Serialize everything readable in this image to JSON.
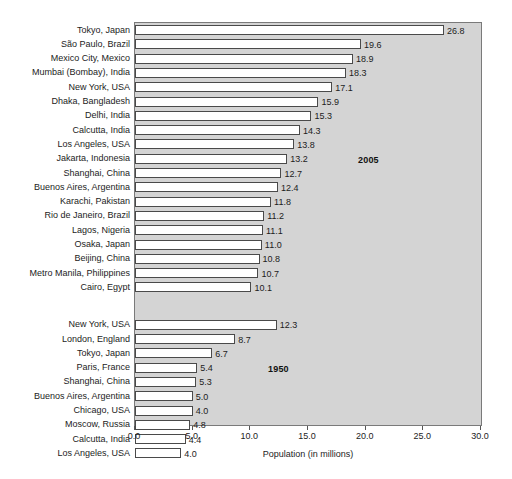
{
  "figure": {
    "clipped_top_text": "",
    "axis_title": "Population (in millions)",
    "group_labels": {
      "upper": "2005",
      "lower": "1950"
    }
  },
  "chart_data": {
    "type": "bar",
    "orientation": "horizontal",
    "title": "",
    "xlabel": "Population (in millions)",
    "ylabel": "",
    "xlim": [
      0.0,
      30.0
    ],
    "xticks": [
      "0.0",
      "5.0",
      "10.0",
      "15.0",
      "20.0",
      "25.0",
      "30.0"
    ],
    "xtick_values": [
      0,
      5,
      10,
      15,
      20,
      25,
      30
    ],
    "grid": false,
    "legend": "none",
    "annotations": [
      "2005",
      "1950"
    ],
    "groups": [
      {
        "name": "2005",
        "categories": [
          "Tokyo, Japan",
          "São Paulo, Brazil",
          "Mexico City, Mexico",
          "Mumbai (Bombay), India",
          "New York, USA",
          "Dhaka, Bangladesh",
          "Delhi, India",
          "Calcutta, India",
          "Los Angeles, USA",
          "Jakarta, Indonesia",
          "Shanghai, China",
          "Buenos Aires, Argentina",
          "Karachi, Pakistan",
          "Rio de Janeiro, Brazil",
          "Lagos, Nigeria",
          "Osaka, Japan",
          "Beijing, China",
          "Metro Manila, Philippines",
          "Cairo, Egypt"
        ],
        "values": [
          26.8,
          19.6,
          18.9,
          18.3,
          17.1,
          15.9,
          15.3,
          14.3,
          13.8,
          13.2,
          12.7,
          12.4,
          11.8,
          11.2,
          11.1,
          11.0,
          10.8,
          10.7,
          10.1
        ],
        "labels": [
          "26.8",
          "19.6",
          "18.9",
          "18.3",
          "17.1",
          "15.9",
          "15.3",
          "14.3",
          "13.8",
          "13.2",
          "12.7",
          "12.4",
          "11.8",
          "11.2",
          "11.1",
          "11.0",
          "10.8",
          "10.7",
          "10.1"
        ]
      },
      {
        "name": "1950",
        "categories": [
          "New York, USA",
          "London, England",
          "Tokyo, Japan",
          "Paris, France",
          "Shanghai, China",
          "Buenos Aires, Argentina",
          "Chicago, USA",
          "Moscow, Russia",
          "Calcutta, India",
          "Los Angeles, USA"
        ],
        "values": [
          12.3,
          8.7,
          6.7,
          5.4,
          5.3,
          5.0,
          5.0,
          4.8,
          4.4,
          4.0
        ],
        "labels": [
          "12.3",
          "8.7",
          "6.7",
          "5.4",
          "5.3",
          "5.0",
          "4.0",
          "4.8",
          "4.4",
          "4.0"
        ]
      }
    ]
  }
}
